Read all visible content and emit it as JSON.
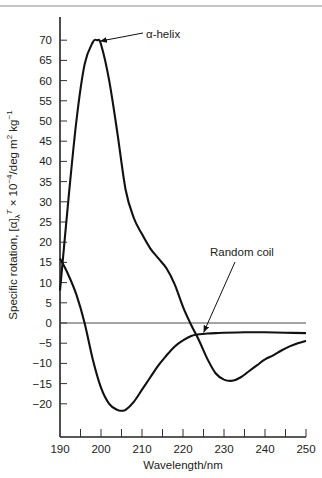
{
  "chart_data": {
    "type": "line",
    "title": "",
    "xlabel": "Wavelength/nm",
    "ylabel": "Specific rotation, [α]λ^T × 10^-4/deg m^2 kg^-1",
    "xlim": [
      190,
      250
    ],
    "ylim": [
      -25,
      75
    ],
    "x_ticks": [
      190,
      200,
      210,
      220,
      230,
      240,
      250
    ],
    "x_minor_step": 5,
    "y_ticks": [
      -20,
      -15,
      -10,
      -5,
      0,
      5,
      10,
      15,
      20,
      25,
      30,
      35,
      40,
      45,
      50,
      55,
      60,
      65,
      70
    ],
    "zero_line": true,
    "grid": false,
    "legend": null,
    "series": [
      {
        "name": "α-helix",
        "x": [
          190,
          192,
          194,
          196,
          198,
          199,
          200,
          202,
          204,
          206,
          208,
          210,
          212,
          214,
          216,
          218,
          220,
          222,
          224,
          226,
          228,
          230,
          232,
          234,
          236,
          238,
          240,
          242,
          244,
          246,
          248,
          250
        ],
        "y": [
          8,
          30,
          50,
          64,
          69.5,
          70,
          69,
          60,
          47,
          33,
          26,
          22,
          18.5,
          16,
          13.5,
          9.5,
          4,
          -0.5,
          -4.5,
          -9,
          -12.5,
          -14,
          -14.3,
          -13.5,
          -12,
          -10.5,
          -9,
          -8,
          -6.8,
          -5.8,
          -5,
          -4.4
        ]
      },
      {
        "name": "Random coil",
        "x": [
          190,
          192,
          194,
          196,
          198,
          200,
          202,
          204,
          205,
          206,
          208,
          210,
          212,
          214,
          216,
          218,
          220,
          222,
          224,
          226,
          228,
          230,
          235,
          240,
          245,
          250
        ],
        "y": [
          16,
          12,
          7,
          0,
          -9,
          -16,
          -20,
          -21.5,
          -21.7,
          -21.5,
          -19.5,
          -16.5,
          -13.5,
          -10.5,
          -8,
          -5.8,
          -4.3,
          -3.2,
          -2.8,
          -2.6,
          -2.5,
          -2.4,
          -2.3,
          -2.3,
          -2.4,
          -2.5
        ]
      }
    ],
    "annotations": [
      {
        "text": "α-helix",
        "points_to": [
          199,
          70
        ]
      },
      {
        "text": "Random coil",
        "points_to": [
          226,
          -2.6
        ]
      }
    ]
  },
  "labels": {
    "xlabel": "Wavelength/nm",
    "ylabel_main": "Specific rotation, ",
    "ylabel_units": "/deg m",
    "alpha_helix": "α-helix",
    "random_coil": "Random coil"
  }
}
